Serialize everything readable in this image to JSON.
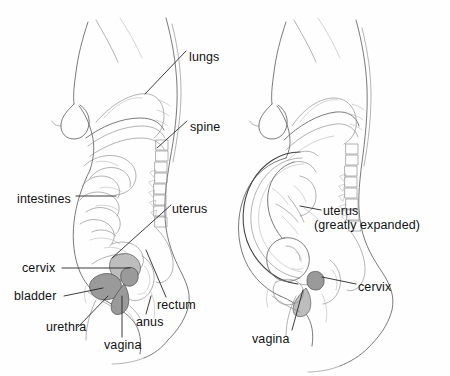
{
  "figure": {
    "type": "anatomical-diagram",
    "title": "",
    "background_color": "#fefefe",
    "line_color": "#4a4a4a",
    "label_color": "#111111",
    "shading_color": "#8b8b8b"
  },
  "panels": [
    {
      "id": "non-pregnant",
      "name": "non-pregnant-figure",
      "labels": [
        {
          "id": "lungs",
          "text": "lungs",
          "x": 189,
          "y": 50,
          "anchor_x": 145,
          "anchor_y": 94
        },
        {
          "id": "spine",
          "text": "spine",
          "x": 190,
          "y": 120,
          "anchor_x": 157,
          "anchor_y": 148
        },
        {
          "id": "intestines",
          "text": "intestines",
          "x": 17,
          "y": 192,
          "anchor_x": 113,
          "anchor_y": 196
        },
        {
          "id": "uterus",
          "text": "uterus",
          "x": 172,
          "y": 202,
          "anchor_x": 112,
          "anchor_y": 258
        },
        {
          "id": "cervix",
          "text": "cervix",
          "x": 22,
          "y": 266,
          "anchor_x": 128,
          "anchor_y": 268
        },
        {
          "id": "bladder",
          "text": "bladder",
          "x": 14,
          "y": 294,
          "anchor_x": 104,
          "anchor_y": 288
        },
        {
          "id": "urethra",
          "text": "urethra",
          "x": 46,
          "y": 331,
          "anchor_x": 108,
          "anchor_y": 296
        },
        {
          "id": "vagina",
          "text": "vagina",
          "x": 104,
          "y": 341,
          "anchor_x": 122,
          "anchor_y": 294
        },
        {
          "id": "anus",
          "text": "anus",
          "x": 136,
          "y": 318,
          "anchor_x": 150,
          "anchor_y": 294
        },
        {
          "id": "rectum",
          "text": "rectum",
          "x": 157,
          "y": 301,
          "anchor_x": 146,
          "anchor_y": 250
        }
      ]
    },
    {
      "id": "pregnant",
      "name": "pregnant-figure",
      "labels": [
        {
          "id": "uterus-expanded-line1",
          "text": "uterus",
          "x": 323,
          "y": 206,
          "anchor_x": 300,
          "anchor_y": 206
        },
        {
          "id": "uterus-expanded-line2",
          "text": "(greatly expanded)",
          "x": 314,
          "y": 220,
          "anchor_x": 0,
          "anchor_y": 0
        },
        {
          "id": "cervix-pregnant",
          "text": "cervix",
          "x": 358,
          "y": 281,
          "anchor_x": 320,
          "anchor_y": 272
        },
        {
          "id": "vagina-pregnant",
          "text": "vagina",
          "x": 252,
          "y": 333,
          "anchor_x": 299,
          "anchor_y": 289
        }
      ]
    }
  ]
}
